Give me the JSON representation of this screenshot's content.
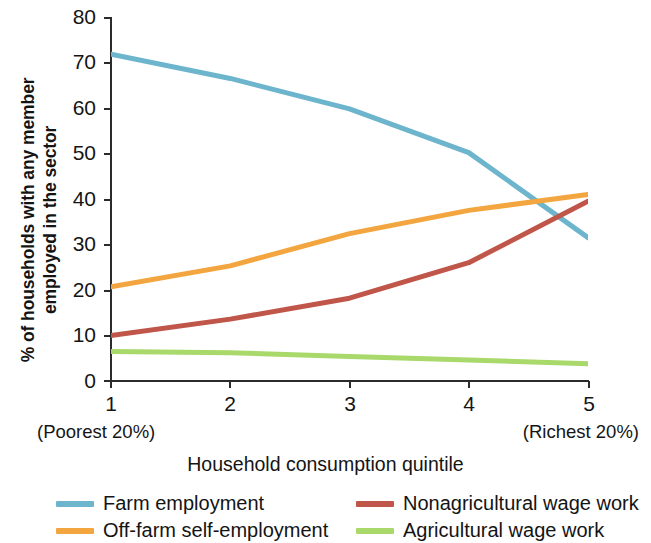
{
  "chart_data": {
    "type": "line",
    "title": "",
    "xlabel": "Household consumption quintile",
    "ylabel": "% of households with any member\nemployed in the sector",
    "categories": [
      "1",
      "2",
      "3",
      "4",
      "5"
    ],
    "x_end_labels": {
      "left": "(Poorest 20%)",
      "right": "(Richest 20%)"
    },
    "xlim": [
      1,
      5
    ],
    "ylim": [
      0,
      80
    ],
    "y_ticks": [
      0,
      10,
      20,
      30,
      40,
      50,
      60,
      70,
      80
    ],
    "grid": false,
    "legend_position": "bottom",
    "series": [
      {
        "name": "Farm employment",
        "color": "#6CB5CC",
        "values": [
          71.8,
          66.5,
          59.8,
          50.2,
          31.5
        ]
      },
      {
        "name": "Off-farm self-employment",
        "color": "#F3A53F",
        "values": [
          20.7,
          25.3,
          32.4,
          37.5,
          41.0
        ]
      },
      {
        "name": "Nonagricultural wage work",
        "color": "#C0564A",
        "values": [
          10.0,
          13.6,
          18.2,
          26.0,
          39.5
        ]
      },
      {
        "name": "Agricultural wage work",
        "color": "#A8D96A",
        "values": [
          6.5,
          6.2,
          5.4,
          4.6,
          3.8
        ]
      }
    ]
  },
  "legend": {
    "items": [
      {
        "label": "Farm employment",
        "color": "#6CB5CC"
      },
      {
        "label": "Nonagricultural wage work",
        "color": "#C0564A"
      },
      {
        "label": "Off-farm self-employment",
        "color": "#F3A53F"
      },
      {
        "label": "Agricultural wage work",
        "color": "#A8D96A"
      }
    ]
  },
  "axes": {
    "y_tick_labels": [
      "80",
      "70",
      "60",
      "50",
      "40",
      "30",
      "20",
      "10",
      "0"
    ],
    "x_tick_labels": [
      "1",
      "2",
      "3",
      "4",
      "5"
    ]
  }
}
